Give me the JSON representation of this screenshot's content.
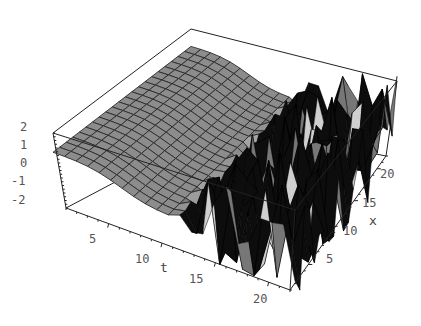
{
  "chart_data": {
    "type": "surface3d",
    "title": "",
    "axes": {
      "t": {
        "label": "t",
        "ticks": [
          "5",
          "10",
          "15",
          "20"
        ],
        "range": [
          1,
          22
        ]
      },
      "x": {
        "label": "x",
        "ticks": [
          "5",
          "10",
          "15",
          "20"
        ],
        "range": [
          1,
          22
        ]
      },
      "z": {
        "label": "",
        "ticks": [
          "2",
          "1",
          "0",
          "-1",
          "-2"
        ],
        "range": [
          -2,
          2
        ]
      }
    },
    "grid": false,
    "box": true,
    "colors": {
      "surface": "#8a8a8a",
      "spikes": "#111111",
      "mesh": "#222222",
      "box": "#222222"
    }
  },
  "labels": {
    "z_ticks": [
      "2",
      "1",
      "0",
      "-1",
      "-2"
    ],
    "t_ticks": [
      "5",
      "10",
      "15",
      "20"
    ],
    "x_ticks": [
      "5",
      "10",
      "15",
      "20"
    ],
    "t_label": "t",
    "x_label": "x"
  }
}
